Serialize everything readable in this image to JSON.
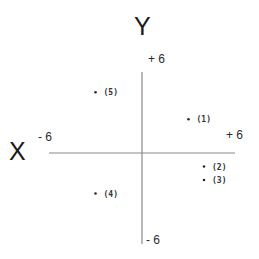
{
  "chart_data": {
    "type": "scatter",
    "title": "",
    "xlabel": "X",
    "ylabel": "Y",
    "xlim": [
      -6,
      6
    ],
    "ylim": [
      -6,
      6
    ],
    "grid": false,
    "tick_labels": {
      "x_min": "- 6",
      "x_max": "+ 6",
      "y_min": "- 6",
      "y_max": "+ 6"
    },
    "points": [
      {
        "label": "(1)",
        "x": 3,
        "y": 2.5
      },
      {
        "label": "(2)",
        "x": 4,
        "y": -1
      },
      {
        "label": "(3)",
        "x": 4,
        "y": -2
      },
      {
        "label": "(4)",
        "x": -3,
        "y": -3
      },
      {
        "label": "(5)",
        "x": -3,
        "y": 4.5
      }
    ]
  },
  "colors": {
    "axis": "#8a8a8a",
    "text": "#1a1a1a"
  }
}
